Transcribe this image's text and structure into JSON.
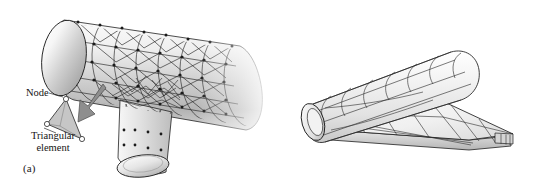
{
  "figure": {
    "background_color": "#ffffff",
    "line_color": "#222222",
    "fill_light": "#f2f2f2",
    "fill_mid": "#d9d9d9",
    "fill_dark": "#b0b0b0",
    "node_marker_color": "#ffffff"
  },
  "panels": [
    {
      "id": "a",
      "caption": "(a)",
      "subject": "tee-pipe-junction-with-triangular-surface-mesh",
      "mesh_type": "triangular",
      "annotations": [
        {
          "name": "node",
          "text": "Node"
        },
        {
          "name": "triangular-element",
          "text": "Triangular\nelement"
        }
      ]
    },
    {
      "id": "b",
      "caption": "(b)",
      "subject": "aircraft-fuselage-and-wing-with-quadrilateral-mesh",
      "mesh_type": "quadrilateral",
      "annotations": []
    }
  ]
}
